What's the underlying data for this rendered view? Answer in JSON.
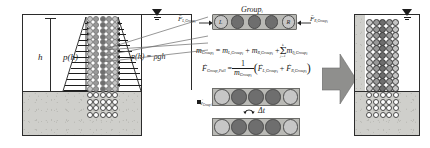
{
  "figure": {
    "type": "schematic-diagram"
  },
  "left_panel": {
    "name": "initial-configuration",
    "labels": {
      "height": "h",
      "pressure_function": "p(h)",
      "pressure_equation": "p(h) = ρgh",
      "water_table_icon": "water-table-triangle"
    },
    "regions": {
      "water_label": "water column",
      "soil_label": "soil bed"
    },
    "pressure_arrow_count": 13,
    "column": {
      "rows_in_water": 13,
      "cols": 5,
      "rows_in_soil": 4
    }
  },
  "middle_panel": {
    "group_box": {
      "label": "Group",
      "label_sub": "i",
      "particles": [
        "L",
        "",
        "",
        "",
        "R"
      ]
    },
    "force_left": {
      "symbol": "F",
      "sub": "L,Group",
      "sub2": "i"
    },
    "force_right": {
      "symbol": "F",
      "sub": "R,Group",
      "sub2": "i"
    },
    "equations": [
      {
        "id": "mass-equation",
        "text": "m_Group_i = m_L,Group_i + m_R,Group_i + Σ_{j=1}^{k} m_{I_j,Group_i}"
      },
      {
        "id": "velocity-equation",
        "text": "v_Group,Pull = (1 / m_Group_i)(F_L,Group_i + F_R,Group_i)"
      }
    ],
    "eq1": {
      "lhs_m": "m",
      "lhs_sub": "Group",
      "lhs_sub_i": "i",
      "eq": "=",
      "t1_m": "m",
      "t1_sub": "L,Group",
      "t1_sub_i": "i",
      "plus1": "+",
      "t2_m": "m",
      "t2_sub": "R,Group",
      "t2_sub_i": "i",
      "plus2": "+",
      "sum_upper": "k",
      "sum_sym": "Σ",
      "sum_lower": "j=1",
      "t3_m": "m",
      "t3_sub": "I",
      "t3_sub_j": "j",
      "t3_sub2": ",Group",
      "t3_sub2_i": "i"
    },
    "eq2": {
      "lhs_v": "F",
      "lhs_sub": "Group,Pull",
      "eq": "=",
      "num": "1",
      "den_m": "m",
      "den_sub": "Group",
      "den_sub_i": "i",
      "open": "(",
      "a_F": "F",
      "a_sub": "L,Group",
      "a_sub_i": "i",
      "plus": "+",
      "b_F": "F",
      "b_sub": "R,Group",
      "b_sub_i": "i",
      "close": ")"
    },
    "timestep": {
      "rot_icon": "rotation-arrow-icon",
      "label": "Δt"
    },
    "velocity_tag": {
      "symbol": "v",
      "sub": "Group",
      "sub_i": "i"
    },
    "frames": [
      {
        "id": "frame-before",
        "caption": "group at time t",
        "particles": 5
      },
      {
        "id": "frame-after",
        "caption": "group at time t + Δt",
        "particles": 5
      }
    ]
  },
  "arrow": {
    "name": "transition-arrow",
    "direction": "right",
    "color": "#9a9a98"
  },
  "right_panel": {
    "name": "deformed-configuration",
    "labels": {
      "water_table_icon": "water-table-triangle"
    },
    "column": {
      "rows_in_water": 11,
      "cols": 5,
      "rows_in_soil": 4
    }
  },
  "colors": {
    "ink": "#1d1d1d",
    "soil_fill": "#cfcfcb",
    "group_fill": "#b9b9b5",
    "particle_dark": "#6e6e6e",
    "particle_mid": "#9a9a9a",
    "particle_light": "#c6c6c6",
    "arrow_grey": "#9a9a98",
    "panel_border": "#2b2b2b"
  }
}
